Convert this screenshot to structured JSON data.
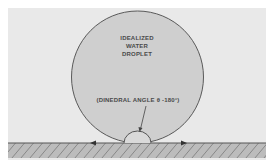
{
  "diagram": {
    "droplet_label_lines": [
      "IDEALIZED",
      "WATER",
      "DROPLET"
    ],
    "angle_label": "(DINEDRAL ANGLE θ -180°)"
  },
  "colors": {
    "background": "#ffffff",
    "panel": "#e9e9e9",
    "droplet_fill": "#cdcdcd",
    "outline": "#555555",
    "ground_fill": "#b9b9b9",
    "hatch": "#6a6a6a",
    "text": "#4a4a4a"
  }
}
